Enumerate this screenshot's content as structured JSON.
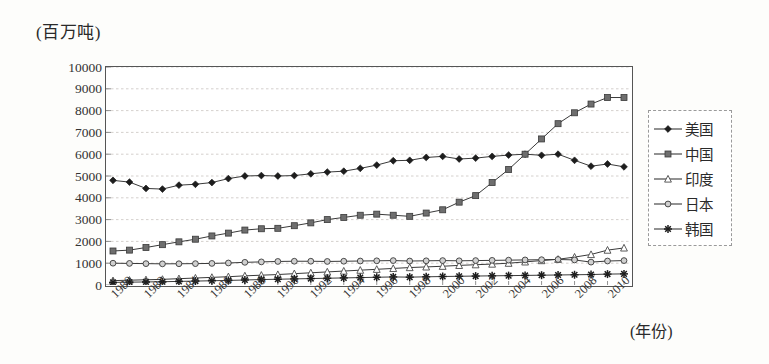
{
  "chart_data": {
    "type": "line",
    "title": "",
    "ylabel": "(百万吨)",
    "xlabel": "(年份)",
    "ylim": [
      0,
      10000
    ],
    "ytick_step": 1000,
    "yticks": [
      "10000",
      "9000",
      "8000",
      "7000",
      "6000",
      "5000",
      "4000",
      "3000",
      "2000",
      "1000",
      "0"
    ],
    "grid": true,
    "legend_position": "right",
    "x": [
      1980,
      1981,
      1982,
      1983,
      1984,
      1985,
      1986,
      1987,
      1988,
      1989,
      1990,
      1991,
      1992,
      1993,
      1994,
      1995,
      1996,
      1997,
      1998,
      1999,
      2000,
      2001,
      2002,
      2003,
      2004,
      2005,
      2006,
      2007,
      2008,
      2009,
      2010,
      2011
    ],
    "xtick_labels": [
      "1980",
      "1982",
      "1984",
      "1986",
      "1988",
      "1990",
      "1992",
      "1994",
      "1996",
      "1998",
      "2000",
      "2002",
      "2004",
      "2006",
      "2008",
      "2010"
    ],
    "series": [
      {
        "name": "美国",
        "marker": "diamond",
        "values": [
          4800,
          4720,
          4430,
          4400,
          4580,
          4620,
          4700,
          4880,
          5000,
          5020,
          5000,
          5020,
          5100,
          5180,
          5220,
          5350,
          5500,
          5700,
          5720,
          5850,
          5900,
          5780,
          5820,
          5900,
          5960,
          6000,
          5950,
          6000,
          5720,
          5450,
          5550,
          5420
        ]
      },
      {
        "name": "中国",
        "marker": "square",
        "values": [
          1560,
          1600,
          1720,
          1850,
          1980,
          2100,
          2250,
          2380,
          2520,
          2580,
          2600,
          2720,
          2850,
          3000,
          3100,
          3200,
          3250,
          3200,
          3150,
          3300,
          3450,
          3800,
          4100,
          4700,
          5300,
          6000,
          6700,
          7400,
          7900,
          8300,
          8600,
          8600
        ]
      },
      {
        "name": "印度",
        "marker": "triangle",
        "values": [
          200,
          220,
          240,
          260,
          290,
          320,
          350,
          380,
          420,
          450,
          480,
          520,
          560,
          600,
          640,
          680,
          720,
          760,
          800,
          830,
          860,
          900,
          930,
          960,
          1000,
          1060,
          1120,
          1180,
          1280,
          1400,
          1600,
          1700
        ]
      },
      {
        "name": "日本",
        "marker": "circle",
        "values": [
          1000,
          990,
          980,
          970,
          975,
          980,
          990,
          1010,
          1040,
          1060,
          1080,
          1090,
          1090,
          1080,
          1090,
          1100,
          1110,
          1120,
          1100,
          1110,
          1120,
          1110,
          1120,
          1130,
          1140,
          1150,
          1160,
          1170,
          1150,
          1050,
          1100,
          1120
        ]
      },
      {
        "name": "韩国",
        "marker": "asterisk",
        "values": [
          120,
          130,
          140,
          150,
          165,
          180,
          195,
          210,
          230,
          250,
          265,
          280,
          295,
          310,
          325,
          340,
          355,
          370,
          360,
          375,
          390,
          400,
          410,
          420,
          430,
          440,
          450,
          460,
          470,
          480,
          500,
          510
        ]
      }
    ]
  }
}
